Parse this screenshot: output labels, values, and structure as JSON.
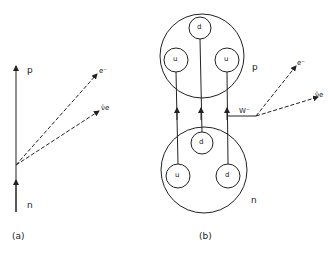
{
  "diagram_a": {
    "caption": "(a)",
    "proton_label": "p",
    "neutron_label": "n",
    "electron_label": "e⁻",
    "antineutrino_label": "ν̄e"
  },
  "diagram_b": {
    "caption": "(b)",
    "proton_label": "p",
    "neutron_label": "n",
    "w_label": "W⁻",
    "electron_label": "e⁻",
    "antineutrino_label": "ν̄e",
    "proton_quarks": [
      "u",
      "d",
      "u"
    ],
    "neutron_quarks": [
      "u",
      "d",
      "d"
    ]
  },
  "colors": {
    "line": "#222222",
    "background": "#ffffff"
  }
}
